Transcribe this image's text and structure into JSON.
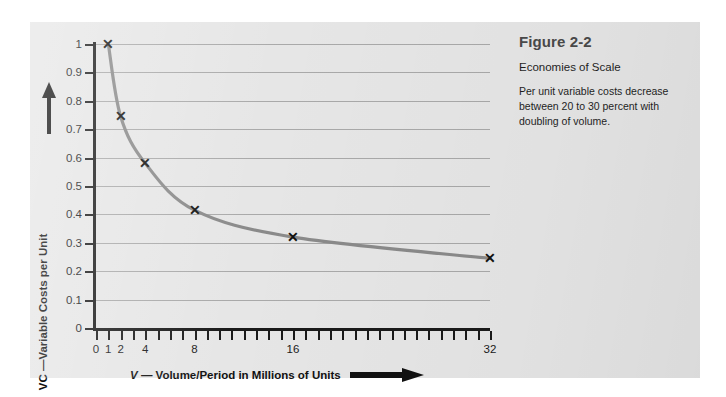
{
  "caption": {
    "title": "Figure 2-2",
    "subtitle": "Economies of Scale",
    "body": "Per unit variable costs decrease between 20 to 30 percent with doubling of volume."
  },
  "axes": {
    "x_title_symbol": "V",
    "x_title_text": "— Volume/Period in Millions of Units",
    "y_title": "VC —Variable Costs per Unit",
    "x_arrow_icon": "arrow-right-icon",
    "y_arrow_icon": "arrow-up-icon"
  },
  "colors": {
    "panel_background": "#e6e6e6",
    "gridline": "#a9a9a9",
    "axis": "#1a1a1a",
    "curve": "#8a8a8a",
    "marker": "#111111",
    "caption_title": "#4a4a4a",
    "text": "#1f1f1f"
  },
  "chart_data": {
    "type": "line",
    "title": "Economies of Scale",
    "xlabel": "V — Volume/Period in Millions of Units",
    "ylabel": "VC —Variable Costs per Unit",
    "xlim": [
      0,
      32
    ],
    "ylim": [
      0,
      1
    ],
    "grid": true,
    "legend": "none",
    "marker": "x",
    "x_tick_labels": [
      "0",
      "1",
      "2",
      "4",
      "8",
      "16",
      "32"
    ],
    "x_tick_values": [
      0,
      1,
      2,
      4,
      8,
      16,
      32
    ],
    "x_minor_tick_step": 1,
    "y_tick_labels": [
      "0",
      "0.1",
      "0.2",
      "0.3",
      "0.4",
      "0.5",
      "0.6",
      "0.7",
      "0.8",
      "0.9",
      "1"
    ],
    "y_tick_values": [
      0,
      0.1,
      0.2,
      0.3,
      0.4,
      0.5,
      0.6,
      0.7,
      0.8,
      0.9,
      1
    ],
    "series": [
      {
        "name": "Variable cost per unit",
        "x": [
          1,
          2,
          4,
          8,
          16,
          32
        ],
        "values": [
          1.0,
          0.745,
          0.58,
          0.415,
          0.32,
          0.245
        ]
      }
    ]
  }
}
